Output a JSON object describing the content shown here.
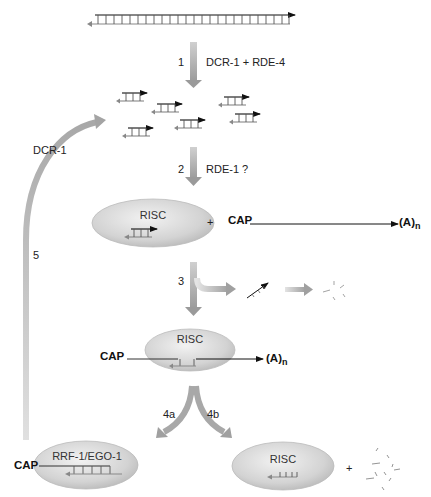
{
  "diagram": {
    "type": "RNAi pathway",
    "steps": [
      {
        "id": "1",
        "number": "1",
        "label": "DCR-1 + RDE-4"
      },
      {
        "id": "2",
        "number": "2",
        "label": "RDE-1 ?"
      },
      {
        "id": "3",
        "number": "3",
        "label": ""
      },
      {
        "id": "4a",
        "number": "4a",
        "label": ""
      },
      {
        "id": "4b",
        "number": "4b",
        "label": ""
      },
      {
        "id": "5",
        "number": "5",
        "label": "DCR-1"
      }
    ],
    "complexes": {
      "risc_top": "RISC",
      "risc_middle": "RISC",
      "rrf": "RRF-1/EGO-1",
      "risc_bottom": "RISC"
    },
    "mrna": {
      "cap": "CAP",
      "polya_base": "(A)",
      "polya_sub": "n"
    },
    "plus": "+",
    "colors": {
      "arrow_gray": "#a8a8a8",
      "ellipse_fill": "#d6d6d6",
      "line_dark": "#111111",
      "strand_gray": "#777777"
    }
  }
}
